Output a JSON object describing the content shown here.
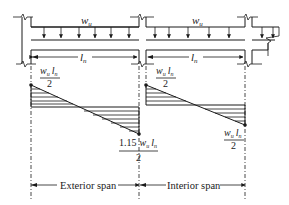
{
  "diagram": {
    "type": "shear-force-diagram",
    "load_label_1": "w",
    "load_label_1_sub": "u",
    "load_label_2": "w",
    "load_label_2_sub": "u",
    "span_label_1": "l",
    "span_label_1_sub": "n",
    "span_label_2": "l",
    "span_label_2_sub": "n",
    "shear_labels": {
      "exterior_left_num": "w",
      "exterior_left_num_sub": "u",
      "exterior_left_num_l": "l",
      "exterior_left_num_l_sub": "n",
      "exterior_left_den": "2",
      "exterior_right_coef": "1.15",
      "exterior_right_num": "w",
      "exterior_right_num_sub": "u",
      "exterior_right_num_l": "l",
      "exterior_right_num_l_sub": "n",
      "exterior_right_den": "2",
      "interior_left_num": "w",
      "interior_left_num_sub": "u",
      "interior_left_num_l": "l",
      "interior_left_num_l_sub": "n",
      "interior_left_den": "2",
      "interior_right_num": "w",
      "interior_right_num_sub": "u",
      "interior_right_num_l": "l",
      "interior_right_num_l_sub": "n",
      "interior_right_den": "2"
    },
    "bottom_labels": {
      "exterior": "Exterior span",
      "interior": "Interior span"
    },
    "colors": {
      "line": "#1a1a1a",
      "background": "#ffffff"
    }
  }
}
